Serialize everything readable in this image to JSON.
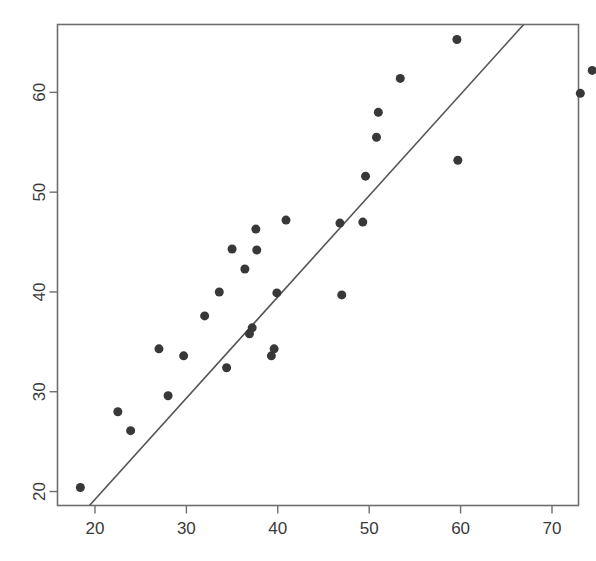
{
  "chart_data": {
    "type": "scatter",
    "title": "",
    "subtitle": "",
    "xlabel": "",
    "ylabel": "",
    "xlim": [
      15.9,
      72.9
    ],
    "ylim": [
      18.6,
      66.8
    ],
    "xticks": [
      20,
      30,
      40,
      50,
      60,
      70
    ],
    "yticks": [
      20,
      30,
      40,
      50,
      60
    ],
    "grid": false,
    "legend": null,
    "legend_position": "none",
    "marker": {
      "shape": "circle",
      "color": "#383838",
      "size_px": 9
    },
    "points": [
      {
        "x": 18.4,
        "y": 20.4
      },
      {
        "x": 22.5,
        "y": 28.0
      },
      {
        "x": 23.9,
        "y": 26.1
      },
      {
        "x": 27.0,
        "y": 34.3
      },
      {
        "x": 28.0,
        "y": 29.6
      },
      {
        "x": 29.7,
        "y": 33.6
      },
      {
        "x": 32.0,
        "y": 37.6
      },
      {
        "x": 33.6,
        "y": 40.0
      },
      {
        "x": 34.4,
        "y": 32.4
      },
      {
        "x": 35.0,
        "y": 44.3
      },
      {
        "x": 36.4,
        "y": 42.3
      },
      {
        "x": 36.9,
        "y": 35.8
      },
      {
        "x": 37.2,
        "y": 36.4
      },
      {
        "x": 37.6,
        "y": 46.3
      },
      {
        "x": 37.7,
        "y": 44.2
      },
      {
        "x": 39.3,
        "y": 33.6
      },
      {
        "x": 39.6,
        "y": 34.3
      },
      {
        "x": 39.9,
        "y": 39.9
      },
      {
        "x": 40.9,
        "y": 47.2
      },
      {
        "x": 46.8,
        "y": 46.9
      },
      {
        "x": 47.0,
        "y": 39.7
      },
      {
        "x": 49.3,
        "y": 47.0
      },
      {
        "x": 49.6,
        "y": 51.6
      },
      {
        "x": 50.8,
        "y": 55.5
      },
      {
        "x": 51.0,
        "y": 58.0
      },
      {
        "x": 53.4,
        "y": 61.4
      },
      {
        "x": 59.6,
        "y": 65.3
      },
      {
        "x": 59.7,
        "y": 53.2
      },
      {
        "x": 73.1,
        "y": 59.9
      },
      {
        "x": 74.4,
        "y": 62.2
      }
    ],
    "reference_line": {
      "label": "",
      "color": "#555555",
      "width_px": 1.6,
      "from": {
        "x": 19.4,
        "y": 18.6
      },
      "to": {
        "x": 66.9,
        "y": 66.8
      },
      "description": "straight diagonal fit line"
    },
    "axes": {
      "box": true,
      "box_color": "#6e6e6e",
      "tick_length_px": 8,
      "tick_color": "#6e6e6e"
    },
    "xtick_labels": [
      "20",
      "30",
      "40",
      "50",
      "60",
      "70"
    ],
    "ytick_labels": [
      "20",
      "30",
      "40",
      "50",
      "60"
    ]
  },
  "figure": {
    "background": "#ffffff",
    "width": 596,
    "height": 561
  }
}
